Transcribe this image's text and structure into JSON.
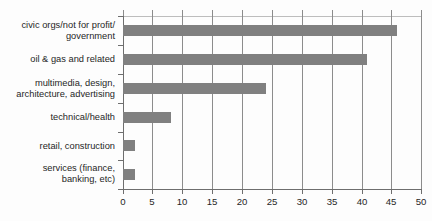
{
  "chart_data": {
    "type": "bar",
    "orientation": "horizontal",
    "title": "",
    "subtitle": "",
    "xlabel": "",
    "ylabel": "",
    "categories": [
      "civic orgs/not for profit/\ngovernment",
      "oil & gas and related",
      "multimedia, design,\narchitecture, advertising",
      "technical/health",
      "retail, construction",
      "services (finance,\nbanking, etc)"
    ],
    "values": [
      46,
      41,
      24,
      8,
      2,
      2
    ],
    "xlim": [
      0,
      50
    ],
    "xticks": [
      0,
      5,
      10,
      15,
      20,
      25,
      30,
      35,
      40,
      45,
      50
    ],
    "xtick_labels": [
      "0",
      "5",
      "10",
      "15",
      "20",
      "25",
      "30",
      "35",
      "40",
      "45",
      "50"
    ],
    "grid": "vertical",
    "legend": "none",
    "bar_color": "#808080",
    "axis_color": "#6e6e6e",
    "gridline_color": "#8c8c8c",
    "background_color": "#fdfdfd"
  }
}
